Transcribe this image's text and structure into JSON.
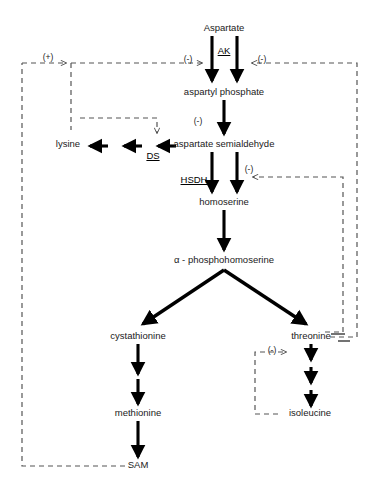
{
  "diagram": {
    "type": "biochemical-pathway",
    "colors": {
      "stroke": "#000000",
      "text": "#1a1a1a",
      "dashed": "#555555",
      "background": "#ffffff"
    },
    "metabolites": [
      {
        "id": "aspartate",
        "label": "Aspartate",
        "x": 224,
        "y": 29
      },
      {
        "id": "aspartyl-phosphate",
        "label": "aspartyl  phosphate",
        "x": 224,
        "y": 93
      },
      {
        "id": "aspartate-semialdehyde",
        "label": "aspartate semialdehyde",
        "x": 224,
        "y": 145
      },
      {
        "id": "homoserine",
        "label": "homoserine",
        "x": 224,
        "y": 203
      },
      {
        "id": "alpha-phosphohomoserine",
        "label": "α - phosphohomoserine",
        "x": 224,
        "y": 261
      },
      {
        "id": "cystathionine",
        "label": "cystathionine",
        "x": 138,
        "y": 337
      },
      {
        "id": "threonine",
        "label": "threonine",
        "x": 311,
        "y": 337
      },
      {
        "id": "methionine",
        "label": "methionine",
        "x": 138,
        "y": 414
      },
      {
        "id": "sam",
        "label": "SAM",
        "x": 138,
        "y": 466
      },
      {
        "id": "isoleucine",
        "label": "isoleucine",
        "x": 310,
        "y": 414
      },
      {
        "id": "lysine",
        "label": "lysine",
        "x": 68,
        "y": 145
      }
    ],
    "enzymes": [
      {
        "id": "ak",
        "label": "AK",
        "x": 224,
        "y": 51,
        "reaction": "aspartate-to-aspartyl-phosphate"
      },
      {
        "id": "ds",
        "label": "DS",
        "x": 153,
        "y": 156,
        "reaction": "aspartate-semialdehyde-to-lysine"
      },
      {
        "id": "hsdh",
        "label": "HSDH",
        "x": 194,
        "y": 180,
        "reaction": "aspartate-semialdehyde-to-homoserine"
      }
    ],
    "regulation": [
      {
        "id": "reg-lysine-ak",
        "sign": "(+)",
        "x": 48,
        "y": 58,
        "effector": "SAM",
        "target": "AK"
      },
      {
        "id": "reg-ak-left",
        "sign": "(-)",
        "x": 188,
        "y": 60,
        "effector": "lysine",
        "target": "AK"
      },
      {
        "id": "reg-ak-right",
        "sign": "(-)",
        "x": 262,
        "y": 60,
        "effector": "threonine",
        "target": "AK"
      },
      {
        "id": "reg-ds",
        "sign": "(-)",
        "x": 198,
        "y": 122,
        "effector": "lysine",
        "target": "DS"
      },
      {
        "id": "reg-hsdh",
        "sign": "(-)",
        "x": 249,
        "y": 170,
        "effector": "threonine",
        "target": "HSDH"
      },
      {
        "id": "reg-threonine-deaminase",
        "sign": "(-)",
        "x": 272,
        "y": 351,
        "effector": "isoleucine",
        "target": "threonine deaminase"
      }
    ]
  }
}
